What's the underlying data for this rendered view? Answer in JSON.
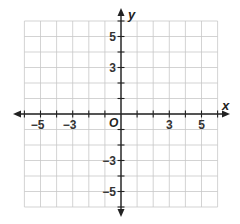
{
  "diagram": {
    "type": "coordinate-plane",
    "x_axis": {
      "label": "x",
      "range": [
        -6,
        6
      ],
      "tick_labels": [
        {
          "value": -5,
          "text": "−5"
        },
        {
          "value": -3,
          "text": "−3"
        },
        {
          "value": 3,
          "text": "3"
        },
        {
          "value": 5,
          "text": "5"
        }
      ]
    },
    "y_axis": {
      "label": "y",
      "range": [
        -6,
        6
      ],
      "tick_labels": [
        {
          "value": 5,
          "text": "5"
        },
        {
          "value": 3,
          "text": "3"
        },
        {
          "value": -3,
          "text": "−3"
        },
        {
          "value": -5,
          "text": "−5"
        }
      ]
    },
    "origin_label": "O",
    "grid": true,
    "colors": {
      "grid": "#c8c8c8",
      "axis": "#222222",
      "label": "#333333"
    }
  }
}
